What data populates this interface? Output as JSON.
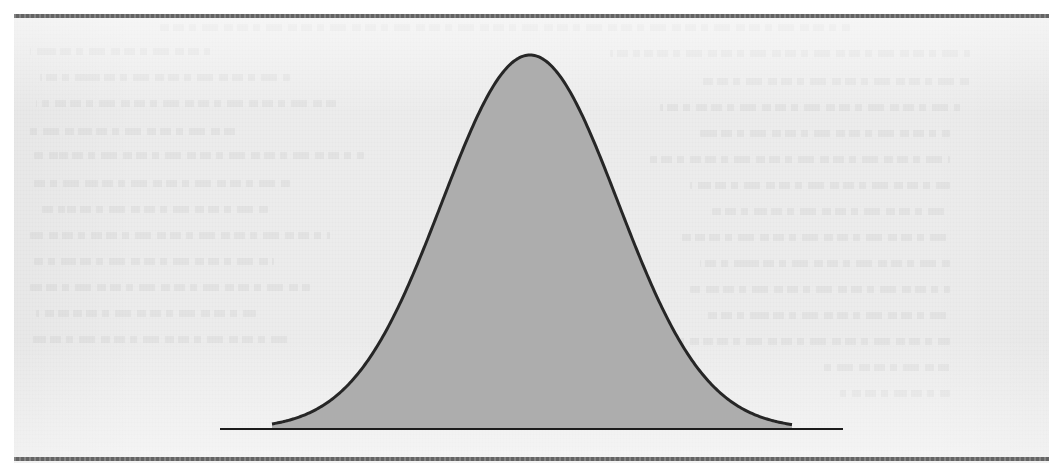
{
  "page": {
    "kind": "scanned-book-page",
    "background_color": "#ececec",
    "margin_color": "#ffffff",
    "rule_color": "#6a6a6a",
    "has_visible_text": false,
    "artifacts": "faint bleed-through ghosting from reverse side of page; no legible text"
  },
  "rules": [
    {
      "name": "top-rule",
      "y": 14,
      "thickness": 4
    },
    {
      "name": "bottom-rule",
      "y": 457,
      "thickness": 4
    }
  ],
  "ghost_lines": [
    {
      "x": 160,
      "y": 24,
      "width": 690
    },
    {
      "x": 30,
      "y": 48,
      "width": 180
    },
    {
      "x": 610,
      "y": 50,
      "width": 360
    },
    {
      "x": 40,
      "y": 74,
      "width": 250
    },
    {
      "x": 700,
      "y": 78,
      "width": 270
    },
    {
      "x": 36,
      "y": 100,
      "width": 300
    },
    {
      "x": 660,
      "y": 104,
      "width": 300
    },
    {
      "x": 28,
      "y": 128,
      "width": 210
    },
    {
      "x": 700,
      "y": 130,
      "width": 250
    },
    {
      "x": 34,
      "y": 152,
      "width": 330
    },
    {
      "x": 650,
      "y": 156,
      "width": 300
    },
    {
      "x": 30,
      "y": 180,
      "width": 260
    },
    {
      "x": 690,
      "y": 182,
      "width": 260
    },
    {
      "x": 38,
      "y": 206,
      "width": 230
    },
    {
      "x": 712,
      "y": 208,
      "width": 238
    },
    {
      "x": 30,
      "y": 232,
      "width": 300
    },
    {
      "x": 680,
      "y": 234,
      "width": 270
    },
    {
      "x": 34,
      "y": 258,
      "width": 240
    },
    {
      "x": 700,
      "y": 260,
      "width": 250
    },
    {
      "x": 30,
      "y": 284,
      "width": 280
    },
    {
      "x": 690,
      "y": 286,
      "width": 260
    },
    {
      "x": 36,
      "y": 310,
      "width": 220
    },
    {
      "x": 706,
      "y": 312,
      "width": 244
    },
    {
      "x": 30,
      "y": 336,
      "width": 260
    },
    {
      "x": 680,
      "y": 338,
      "width": 270
    },
    {
      "x": 820,
      "y": 364,
      "width": 130
    },
    {
      "x": 840,
      "y": 390,
      "width": 110
    }
  ],
  "chart_data": {
    "type": "line",
    "title": "",
    "subtitle": "",
    "xlabel": "",
    "ylabel": "",
    "legend": [],
    "legend_position": "none",
    "grid": false,
    "axes_visible": false,
    "distribution": "normal",
    "curve_color": "#262626",
    "curve_width": 3,
    "fill_color": "#adadad",
    "baseline_color": "#1c1c1c",
    "baseline_width": 2,
    "peak_x": 530,
    "peak_y": 55,
    "mean_px": 530,
    "sigma_px": 88,
    "baseline_y": 429,
    "baseline_x_start": 220,
    "baseline_x_end": 843,
    "curve_x_start": 272,
    "curve_x_end": 792,
    "xlim": [
      220,
      843
    ],
    "ylim": [
      0,
      1
    ],
    "tick_labels_x": [],
    "tick_labels_y": [],
    "annotations": [],
    "x": [
      272,
      292,
      312,
      332,
      352,
      372,
      392,
      412,
      432,
      452,
      472,
      492,
      512,
      530,
      548,
      568,
      588,
      608,
      628,
      648,
      668,
      688,
      708,
      728,
      748,
      768,
      792
    ],
    "y": [
      0.012,
      0.021,
      0.036,
      0.059,
      0.093,
      0.141,
      0.204,
      0.284,
      0.378,
      0.482,
      0.589,
      0.692,
      0.824,
      1.0,
      0.98,
      0.909,
      0.804,
      0.68,
      0.55,
      0.427,
      0.317,
      0.224,
      0.15,
      0.096,
      0.058,
      0.033,
      0.012
    ]
  }
}
